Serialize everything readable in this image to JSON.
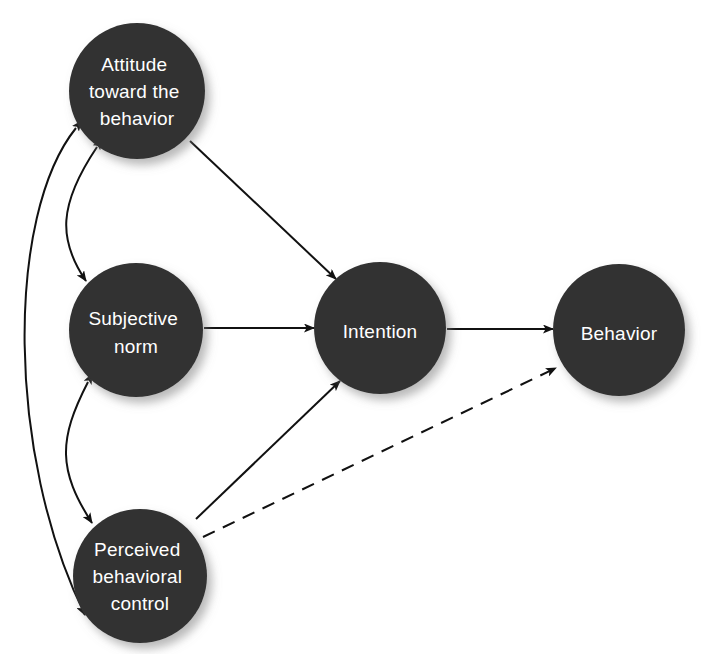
{
  "diagram": {
    "type": "node-link",
    "background_color": "#ffffff",
    "node_fill_color": "#333333",
    "node_label_color": "#ffffff",
    "edge_color": "#111111",
    "nodes": [
      {
        "id": "attitude",
        "label_lines": [
          "Attitude",
          "toward the",
          "behavior"
        ],
        "cx": 137,
        "cy": 91,
        "r": 68
      },
      {
        "id": "subjective_norm",
        "label_lines": [
          "Subjective",
          "norm"
        ],
        "cx": 136,
        "cy": 330,
        "r": 67
      },
      {
        "id": "perceived_behavioral_control",
        "label_lines": [
          "Perceived",
          "behavioral",
          "control"
        ],
        "cx": 140,
        "cy": 576,
        "r": 67
      },
      {
        "id": "intention",
        "label_lines": [
          "Intention"
        ],
        "cx": 380,
        "cy": 328,
        "r": 66
      },
      {
        "id": "behavior",
        "label_lines": [
          "Behavior"
        ],
        "cx": 619,
        "cy": 330,
        "r": 66
      }
    ],
    "edges": [
      {
        "id": "attitude-to-intention",
        "from": "attitude",
        "to": "intention",
        "style": "solid",
        "arrows": "single"
      },
      {
        "id": "subjective-norm-to-intention",
        "from": "subjective_norm",
        "to": "intention",
        "style": "solid",
        "arrows": "single"
      },
      {
        "id": "pbc-to-intention",
        "from": "perceived_behavioral_control",
        "to": "intention",
        "style": "solid",
        "arrows": "single"
      },
      {
        "id": "intention-to-behavior",
        "from": "intention",
        "to": "behavior",
        "style": "solid",
        "arrows": "single"
      },
      {
        "id": "pbc-to-behavior",
        "from": "perceived_behavioral_control",
        "to": "behavior",
        "style": "dashed",
        "arrows": "single"
      },
      {
        "id": "attitude-subjective-norm",
        "from": "attitude",
        "to": "subjective_norm",
        "style": "solid-curved",
        "arrows": "double"
      },
      {
        "id": "subjective-norm-pbc",
        "from": "subjective_norm",
        "to": "perceived_behavioral_control",
        "style": "solid-curved",
        "arrows": "double"
      },
      {
        "id": "attitude-pbc",
        "from": "attitude",
        "to": "perceived_behavioral_control",
        "style": "solid-curved",
        "arrows": "double"
      }
    ]
  }
}
